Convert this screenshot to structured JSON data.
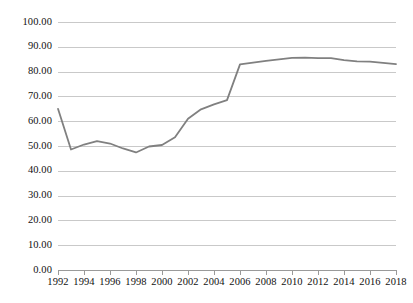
{
  "chart_data": {
    "type": "line",
    "title": "",
    "subtitle": "",
    "xlabel": "",
    "ylabel": "",
    "xlim": [
      1992,
      2018
    ],
    "ylim": [
      0,
      100
    ],
    "grid": true,
    "legend": false,
    "legend_position": "none",
    "line_color": "#808080",
    "gridline_color": "#c9c9c9",
    "axis_color": "#9a9a9a",
    "y_ticks": [
      0,
      10,
      20,
      30,
      40,
      50,
      60,
      70,
      80,
      90,
      100
    ],
    "y_tick_labels": [
      "0.00",
      "10.00",
      "20.00",
      "30.00",
      "40.00",
      "50.00",
      "60.00",
      "70.00",
      "80.00",
      "90.00",
      "100.00"
    ],
    "x_ticks": [
      1992,
      1994,
      1996,
      1998,
      2000,
      2002,
      2004,
      2006,
      2008,
      2010,
      2012,
      2014,
      2016,
      2018
    ],
    "x_tick_labels": [
      "1992",
      "1994",
      "1996",
      "1998",
      "2000",
      "2002",
      "2004",
      "2006",
      "2008",
      "2010",
      "2012",
      "2014",
      "2016",
      "2018"
    ],
    "x": [
      1992,
      1993,
      1994,
      1995,
      1996,
      1997,
      1998,
      1999,
      2000,
      2001,
      2002,
      2003,
      2004,
      2005,
      2006,
      2007,
      2008,
      2009,
      2010,
      2011,
      2012,
      2013,
      2014,
      2015,
      2016,
      2017,
      2018
    ],
    "values": [
      65.0,
      48.6,
      50.6,
      52.0,
      51.0,
      49.0,
      47.4,
      49.8,
      50.4,
      53.5,
      61.0,
      64.8,
      66.8,
      68.5,
      82.9,
      83.6,
      84.3,
      84.9,
      85.5,
      85.6,
      85.4,
      85.4,
      84.6,
      84.1,
      84.0,
      83.5,
      83.0
    ],
    "series": [
      {
        "name": "series-1",
        "color": "#808080",
        "values": [
          65.0,
          48.6,
          50.6,
          52.0,
          51.0,
          49.0,
          47.4,
          49.8,
          50.4,
          53.5,
          61.0,
          64.8,
          66.8,
          68.5,
          82.9,
          83.6,
          84.3,
          84.9,
          85.5,
          85.6,
          85.4,
          85.4,
          84.6,
          84.1,
          84.0,
          83.5,
          83.0
        ]
      }
    ]
  }
}
